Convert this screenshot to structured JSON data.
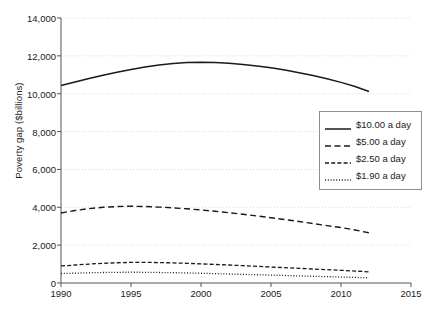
{
  "chart_data": {
    "type": "line",
    "title": "",
    "xlabel": "",
    "ylabel": "Poverty gap ($billions)",
    "xlim": [
      1990,
      2015
    ],
    "ylim": [
      0,
      14000
    ],
    "grid": true,
    "legend_position": "center-right",
    "x_ticks": [
      "1990",
      "1995",
      "2000",
      "2005",
      "2010",
      "2015"
    ],
    "x_tick_values": [
      1990,
      1995,
      2000,
      2005,
      2010,
      2015
    ],
    "y_ticks": [
      "0",
      "2,000",
      "4,000",
      "6,000",
      "8,000",
      "10,000",
      "12,000",
      "14,000"
    ],
    "y_tick_values": [
      0,
      2000,
      4000,
      6000,
      8000,
      10000,
      12000,
      14000
    ],
    "x": [
      1990,
      1991,
      1992,
      1993,
      1994,
      1995,
      1996,
      1997,
      1998,
      1999,
      2000,
      2001,
      2002,
      2003,
      2004,
      2005,
      2006,
      2007,
      2008,
      2009,
      2010,
      2011,
      2012
    ],
    "series": [
      {
        "name": "$10.00 a day",
        "style": "solid",
        "color": "#1a1a1a",
        "values": [
          10430,
          10620,
          10800,
          10970,
          11130,
          11280,
          11410,
          11520,
          11600,
          11650,
          11660,
          11650,
          11610,
          11550,
          11470,
          11370,
          11250,
          11110,
          10960,
          10790,
          10600,
          10380,
          10120
        ]
      },
      {
        "name": "$5.00 a day",
        "style": "long-dash",
        "color": "#1a1a1a",
        "values": [
          3700,
          3830,
          3930,
          4000,
          4040,
          4055,
          4040,
          4010,
          3970,
          3920,
          3860,
          3790,
          3710,
          3630,
          3540,
          3450,
          3350,
          3250,
          3140,
          3030,
          2930,
          2800,
          2650
        ]
      },
      {
        "name": "$2.50 a day",
        "style": "dash",
        "color": "#1a1a1a",
        "values": [
          900,
          950,
          1000,
          1040,
          1070,
          1090,
          1090,
          1080,
          1060,
          1040,
          1010,
          980,
          950,
          915,
          880,
          845,
          810,
          775,
          740,
          705,
          670,
          630,
          590
        ]
      },
      {
        "name": "$1.90 a day",
        "style": "dotted",
        "color": "#1a1a1a",
        "values": [
          500,
          520,
          540,
          555,
          565,
          570,
          565,
          555,
          545,
          530,
          515,
          495,
          475,
          455,
          435,
          415,
          395,
          375,
          355,
          335,
          315,
          295,
          275
        ]
      }
    ]
  },
  "legend": {
    "items": [
      {
        "label": "$10.00 a day"
      },
      {
        "label": "$5.00 a day"
      },
      {
        "label": "$2.50 a day"
      },
      {
        "label": "$1.90 a day"
      }
    ]
  },
  "axis": {
    "y_title": "Poverty gap ($billions)"
  },
  "colors": {
    "line": "#1a1a1a",
    "grid": "#d9d9d9",
    "axis": "#555555",
    "background": "#ffffff",
    "legend_border": "#8d8d8d"
  }
}
